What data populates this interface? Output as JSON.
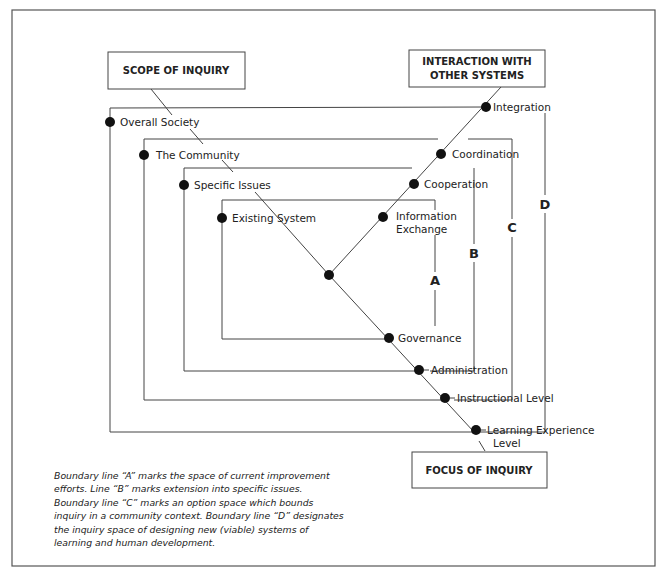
{
  "title_boxes": {
    "scope": "SCOPE OF INQUIRY",
    "interaction_line1": "INTERACTION WITH",
    "interaction_line2": "OTHER SYSTEMS",
    "focus": "FOCUS OF INQUIRY"
  },
  "scope_levels": [
    {
      "label": "Overall Society"
    },
    {
      "label": "The Community"
    },
    {
      "label": "Specific Issues"
    },
    {
      "label": "Existing System"
    }
  ],
  "interaction_levels": [
    {
      "label": "Integration"
    },
    {
      "label": "Coordination"
    },
    {
      "label": "Cooperation"
    },
    {
      "label_line1": "Information",
      "label_line2": "Exchange"
    }
  ],
  "focus_levels": [
    {
      "label": "Governance"
    },
    {
      "label": "Administration"
    },
    {
      "label": "Instructional Level"
    },
    {
      "label_line1": "Learning Experience",
      "label_line2": "Level"
    }
  ],
  "boundary_letters": {
    "a": "A",
    "b": "B",
    "c": "C",
    "d": "D"
  },
  "caption": "Boundary line “A” marks the space of current improvement efforts. Line “B” marks extension into specific issues. Boundary line “C” marks an option space which bounds inquiry in a community context. Boundary line “D” designates the inquiry space of designing new (viable) systems of learning and human development."
}
